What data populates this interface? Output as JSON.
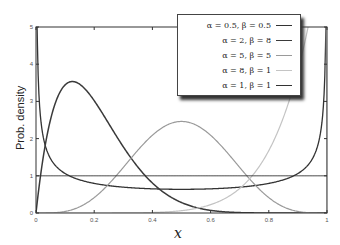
{
  "chart_data": {
    "type": "line",
    "title": "",
    "xlabel": "x",
    "ylabel": "Prob. density",
    "xlim": [
      0,
      1
    ],
    "ylim": [
      0,
      5
    ],
    "xticks": [
      "0",
      "0.2",
      "0.4",
      "0.6",
      "0.8",
      "1"
    ],
    "yticks": [
      "0",
      "1",
      "2",
      "3",
      "4",
      "5"
    ],
    "grid": false,
    "legend_position": "upper right",
    "series": [
      {
        "name": "α = 0.5, β = 0.5",
        "alpha": 0.5,
        "beta": 0.5,
        "color": "#333333",
        "width": 1.3
      },
      {
        "name": "α = 2, β = 8",
        "alpha": 2,
        "beta": 8,
        "color": "#3a3a3a",
        "width": 1.5
      },
      {
        "name": "α = 5, β = 5",
        "alpha": 5,
        "beta": 5,
        "color": "#9a9a9a",
        "width": 1.2
      },
      {
        "name": "α = 8, β = 1",
        "alpha": 8,
        "beta": 1,
        "color": "#c4c4c4",
        "width": 1.2
      },
      {
        "name": "α = 1, β = 1",
        "alpha": 1,
        "beta": 1,
        "color": "#333333",
        "width": 1.0
      }
    ]
  },
  "legend": {
    "items": [
      {
        "label": "α = 0.5, β = 0.5"
      },
      {
        "label": "α = 2, β = 8"
      },
      {
        "label": "α = 5, β = 5"
      },
      {
        "label": "α = 8, β = 1"
      },
      {
        "label": "α = 1, β = 1"
      }
    ]
  },
  "axes": {
    "xlabel": "x",
    "ylabel": "Prob. density"
  }
}
